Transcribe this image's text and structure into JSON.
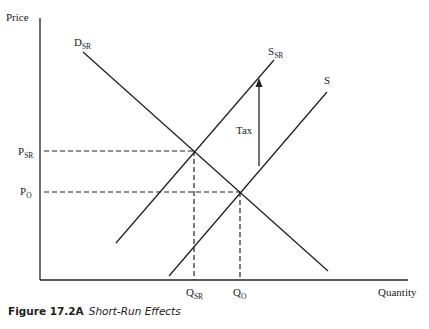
{
  "axes": {
    "y_label": "Price",
    "x_label": "Quantity"
  },
  "curves": {
    "demand": {
      "main": "D",
      "sub": "SR"
    },
    "supply_short_run": {
      "main": "S",
      "sub": "SR"
    },
    "supply": {
      "main": "S"
    }
  },
  "prices": {
    "p_sr": {
      "main": "P",
      "sub": "SR"
    },
    "p_o": {
      "main": "P",
      "sub": "O"
    }
  },
  "quantities": {
    "q_sr": {
      "main": "Q",
      "sub": "SR"
    },
    "q_o": {
      "main": "Q",
      "sub": "O"
    }
  },
  "annotation": {
    "tax": "Tax"
  },
  "caption": {
    "number": "Figure 17.2A",
    "title": "Short-Run Effects"
  }
}
